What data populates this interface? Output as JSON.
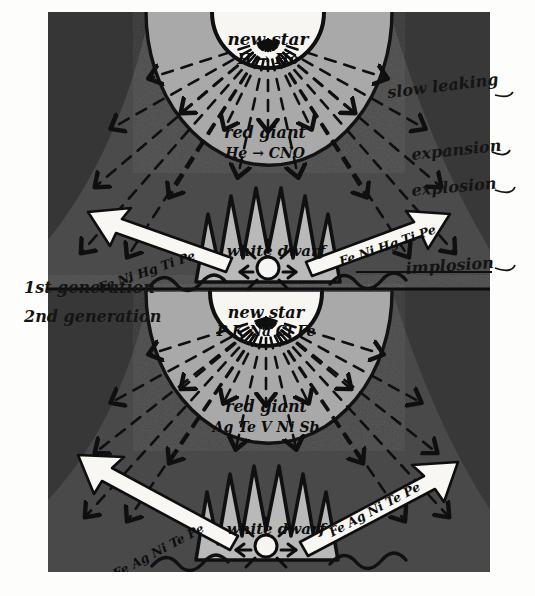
{
  "figure": {
    "medium": "hand-drawn ink sketch on gray wash panel",
    "panel": {
      "background_dark": "#3a3a3a",
      "background_mid": "#5d5d5d",
      "arc_band": "#a7a7a7",
      "core_white": "#f6f5f1",
      "ink": "#111111",
      "paper": "#fdfdfb"
    }
  },
  "margin_labels": [
    {
      "id": "gen1",
      "text": "1st generation"
    },
    {
      "id": "gen2",
      "text": "2nd generation"
    }
  ],
  "right_labels": [
    {
      "id": "slow-leaking",
      "text": "slow leaking"
    },
    {
      "id": "expansion",
      "text": "expansion"
    },
    {
      "id": "explosion",
      "text": "explosion"
    },
    {
      "id": "implosion",
      "text": "implosion"
    }
  ],
  "generation_1": {
    "new_star": {
      "label": "new star",
      "reaction": "H → He"
    },
    "red_giant": {
      "label": "red giant",
      "reaction": "He → CNO"
    },
    "white_dwarf": {
      "label": "white dwarf"
    },
    "ejecta_left": {
      "text": "Fe Ni Hg Ti Pe",
      "direction": "left"
    },
    "ejecta_right": {
      "text": "Fe Ni Hg Ti Pe",
      "direction": "right"
    }
  },
  "generation_2": {
    "new_star": {
      "label": "new star",
      "reaction": "P K Na Cl Fe"
    },
    "red_giant": {
      "label": "red giant",
      "reaction": "Ag Te V Ni Sb"
    },
    "white_dwarf": {
      "label": "white dwarf"
    },
    "ejecta_left": {
      "text": "Fe Ag Ni Te Pe",
      "direction": "left"
    },
    "ejecta_right": {
      "text": "Fe Ag Ni Te Pe",
      "direction": "right"
    }
  }
}
